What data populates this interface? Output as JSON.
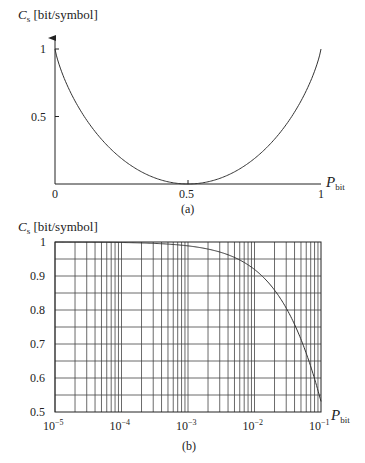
{
  "chart_data": [
    {
      "id": "a",
      "type": "line",
      "caption": "(a)",
      "title": "",
      "ylabel": {
        "symbol": "C",
        "sub": "s",
        "unit": "[bit/symbol]"
      },
      "xlabel": {
        "symbol": "P",
        "sub": "bit"
      },
      "xlim": [
        0,
        1
      ],
      "ylim": [
        0,
        1
      ],
      "x_ticks": [
        "0",
        "0.5",
        "1"
      ],
      "y_ticks": [
        "0.5",
        "1"
      ],
      "grid": false,
      "series": [
        {
          "name": "C_s = 1 - H(P_bit)",
          "x": [
            0,
            0.05,
            0.1,
            0.2,
            0.3,
            0.4,
            0.5,
            0.6,
            0.7,
            0.8,
            0.9,
            0.95,
            1
          ],
          "y": [
            1,
            0.71,
            0.53,
            0.28,
            0.12,
            0.03,
            0,
            0.03,
            0.12,
            0.28,
            0.53,
            0.71,
            1
          ]
        }
      ]
    },
    {
      "id": "b",
      "type": "line",
      "caption": "(b)",
      "title": "",
      "ylabel": {
        "symbol": "C",
        "sub": "s",
        "unit": "[bit/symbol]"
      },
      "xlabel": {
        "symbol": "P",
        "sub": "bit"
      },
      "xscale": "log",
      "xlim": [
        1e-05,
        0.1
      ],
      "ylim": [
        0.5,
        1
      ],
      "x_ticks": [
        {
          "base": "10",
          "exp": "−5"
        },
        {
          "base": "10",
          "exp": "−4"
        },
        {
          "base": "10",
          "exp": "−3"
        },
        {
          "base": "10",
          "exp": "−2"
        },
        {
          "base": "10",
          "exp": "−1"
        }
      ],
      "y_ticks": [
        "0.5",
        "0.6",
        "0.7",
        "0.8",
        "0.9",
        "1"
      ],
      "grid": true,
      "series": [
        {
          "name": "C_s = 1 - H(P_bit)",
          "x": [
            1e-05,
            0.0001,
            0.001,
            0.003,
            0.01,
            0.02,
            0.03,
            0.05,
            0.07,
            0.1
          ],
          "y": [
            1.0,
            0.998,
            0.989,
            0.971,
            0.919,
            0.859,
            0.806,
            0.714,
            0.634,
            0.531
          ]
        }
      ]
    }
  ]
}
